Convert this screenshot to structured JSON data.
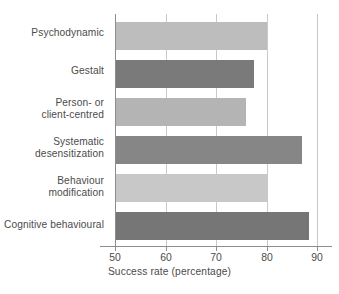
{
  "chart_data": {
    "type": "bar",
    "orientation": "horizontal",
    "title": "",
    "xlabel": "Success rate (percentage)",
    "ylabel": "",
    "xlim": [
      50,
      90
    ],
    "xticks": [
      50,
      60,
      70,
      80,
      90
    ],
    "grid": "vertical gridlines at 60, 70, 80, 90",
    "legend": "none",
    "categories": [
      "Psychodynamic",
      "Gestalt",
      "Person- or client-centred",
      "Systematic desensitization",
      "Behaviour modification",
      "Cognitive behavioural"
    ],
    "values": [
      80,
      77.5,
      76,
      87,
      80,
      88.5
    ],
    "bar_colors": [
      "#bdbdbd",
      "#7a7a7a",
      "#b4b4b4",
      "#868686",
      "#c8c8c8",
      "#767676"
    ]
  },
  "axis": {
    "x_title": "Success rate (percentage)",
    "tick_labels": [
      "50",
      "60",
      "70",
      "80",
      "90"
    ]
  },
  "bars": [
    {
      "label_line1": "Psychodynamic",
      "label_line2": "",
      "value": 80,
      "color": "#bdbdbd"
    },
    {
      "label_line1": "Gestalt",
      "label_line2": "",
      "value": 77.5,
      "color": "#7a7a7a"
    },
    {
      "label_line1": "Person- or",
      "label_line2": "client-centred",
      "value": 76,
      "color": "#b4b4b4"
    },
    {
      "label_line1": "Systematic",
      "label_line2": "desensitization",
      "value": 87,
      "color": "#868686"
    },
    {
      "label_line1": "Behaviour",
      "label_line2": "modification",
      "value": 80,
      "color": "#c8c8c8"
    },
    {
      "label_line1": "Cognitive behavioural",
      "label_line2": "",
      "value": 88.5,
      "color": "#767676"
    }
  ],
  "colors": {
    "axis": "#8c8c8c",
    "grid": "#c9c9c9",
    "text": "#4b4b4b",
    "background": "#ffffff"
  }
}
